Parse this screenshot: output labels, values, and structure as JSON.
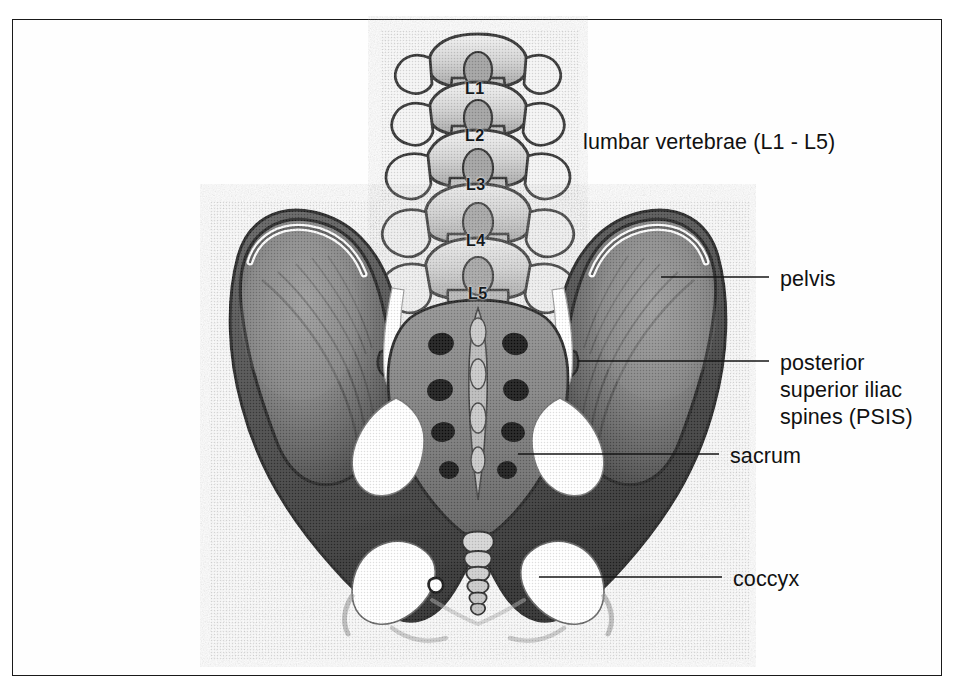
{
  "figure": {
    "kind": "anatomical-illustration",
    "border_color": "#1a1a1a",
    "background_color": "#ffffff",
    "ink_color": "#111111"
  },
  "callouts": [
    {
      "id": "lumbar-vertebrae",
      "text": "lumbar vertebrae (L1 - L5)",
      "x": 583,
      "y": 129,
      "has_leader": false
    },
    {
      "id": "pelvis",
      "text": "pelvis",
      "x": 780,
      "y": 266,
      "has_leader": true,
      "leader": {
        "x1": 661,
        "y1": 277,
        "x2": 769,
        "y2": 277
      }
    },
    {
      "id": "psis",
      "text": "posterior\nsuperior iliac\nspines (PSIS)",
      "lines": [
        "posterior",
        "superior iliac",
        "spines (PSIS)"
      ],
      "x": 780,
      "y": 350,
      "has_leader": true,
      "leader": {
        "x1": 578,
        "y1": 361,
        "x2": 769,
        "y2": 361
      }
    },
    {
      "id": "sacrum",
      "text": "sacrum",
      "x": 730,
      "y": 443,
      "has_leader": true,
      "leader": {
        "x1": 518,
        "y1": 454,
        "x2": 719,
        "y2": 454
      }
    },
    {
      "id": "coccyx",
      "text": "coccyx",
      "x": 733,
      "y": 566,
      "has_leader": true,
      "leader": {
        "x1": 539,
        "y1": 577,
        "x2": 722,
        "y2": 577
      }
    }
  ],
  "vertebra_labels": [
    {
      "id": "L1",
      "text": "L1",
      "x": 465,
      "y": 80
    },
    {
      "id": "L2",
      "text": "L2",
      "x": 465,
      "y": 127
    },
    {
      "id": "L3",
      "text": "L3",
      "x": 466,
      "y": 176
    },
    {
      "id": "L4",
      "text": "L4",
      "x": 466,
      "y": 232
    },
    {
      "id": "L5",
      "text": "L5",
      "x": 468,
      "y": 285
    }
  ]
}
